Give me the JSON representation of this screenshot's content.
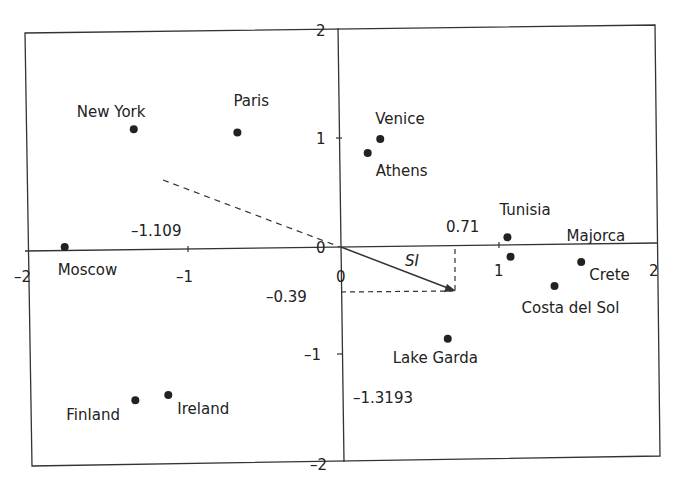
{
  "chart_data": {
    "type": "scatter",
    "title": "",
    "xlabel": "",
    "ylabel": "",
    "xlim": [
      -2,
      2
    ],
    "ylim": [
      -2,
      2
    ],
    "grid": false,
    "legend": null,
    "x_ticks": [
      "-2",
      "-1",
      "0",
      "1",
      "2"
    ],
    "y_ticks": [
      "2",
      "1",
      "0",
      "-1",
      "-2"
    ],
    "points": [
      {
        "label": "New York",
        "x": -1.32,
        "y": 1.09
      },
      {
        "label": "Paris",
        "x": -0.66,
        "y": 1.06
      },
      {
        "label": "Venice",
        "x": 0.25,
        "y": 1.0
      },
      {
        "label": "Athens",
        "x": 0.17,
        "y": 0.87
      },
      {
        "label": "Moscow",
        "x": -1.76,
        "y": 0.0
      },
      {
        "label": "Tunisia",
        "x": 1.06,
        "y": 0.09
      },
      {
        "label": "Majorca",
        "x": 1.08,
        "y": -0.09
      },
      {
        "label": "Crete",
        "x": 1.53,
        "y": -0.14
      },
      {
        "label": "Costa del Sol",
        "x": 1.36,
        "y": -0.36
      },
      {
        "label": "Lake Garda",
        "x": 0.68,
        "y": -0.85
      },
      {
        "label": "Finland",
        "x": -1.31,
        "y": -1.42
      },
      {
        "label": "Ireland",
        "x": -1.1,
        "y": -1.37
      }
    ],
    "vector": {
      "label": "SI",
      "x": 0.71,
      "y": -0.39
    },
    "dashed_direction": {
      "x": -1.13,
      "y": 0.62
    },
    "annotations": [
      "0.71",
      "-0.39",
      "-1.109",
      "-1.3193",
      "SI"
    ]
  }
}
